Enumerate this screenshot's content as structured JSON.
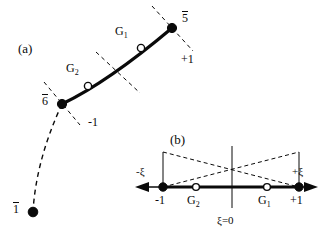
{
  "figure": {
    "type": "diagram",
    "background_color": "#ffffff",
    "line_color": "#0a0a0a"
  },
  "panel_a": {
    "tag": "(a)",
    "tag_pos": {
      "x": 18,
      "y": 42
    },
    "curve": {
      "kind": "thick-solid-arc",
      "stroke_width": 3,
      "start": {
        "x": 62,
        "y": 104
      },
      "control": {
        "x": 110,
        "y": 80
      },
      "end": {
        "x": 172,
        "y": 28
      }
    },
    "dashed_tail": {
      "kind": "thin-dashed-arc",
      "from": {
        "x": 62,
        "y": 104
      },
      "control": {
        "x": 36,
        "y": 160
      },
      "to": {
        "x": 33,
        "y": 212
      }
    },
    "nodes": [
      {
        "name": "node-6bar",
        "label": "6",
        "overbar": true,
        "fill": "filled",
        "x": 62,
        "y": 104,
        "label_pos": {
          "x": 42,
          "y": 96
        }
      },
      {
        "name": "node-G2",
        "label": "G",
        "sub": "2",
        "overbar": false,
        "fill": "open",
        "x": 88,
        "y": 86,
        "label_pos": {
          "x": 66,
          "y": 65
        }
      },
      {
        "name": "node-G1",
        "label": "G",
        "sub": "1",
        "overbar": false,
        "fill": "open",
        "x": 141,
        "y": 48,
        "label_pos": {
          "x": 115,
          "y": 28
        }
      },
      {
        "name": "node-5bar",
        "label": "5",
        "overbar": true,
        "fill": "filled",
        "x": 172,
        "y": 28,
        "label_pos": {
          "x": 182,
          "y": 13
        }
      },
      {
        "name": "node-1bar",
        "label": "1",
        "overbar": true,
        "fill": "filled",
        "x": 33,
        "y": 212,
        "label_pos": {
          "x": 13,
          "y": 203
        }
      }
    ],
    "cross_ticks": [
      {
        "name": "tick-at-node-5bar",
        "cx": 172,
        "cy": 28,
        "angle_deg": -40,
        "len": 54,
        "label": "+1",
        "label_pos": {
          "x": 180,
          "y": 56
        }
      },
      {
        "name": "tick-midpoint",
        "cx": 118,
        "cy": 73,
        "angle_deg": -42,
        "len": 58,
        "label": "",
        "label_pos": null
      },
      {
        "name": "tick-at-node-6bar",
        "cx": 62,
        "cy": 104,
        "angle_deg": -50,
        "len": 56,
        "label": "-1",
        "label_pos": {
          "x": 88,
          "y": 118
        }
      }
    ]
  },
  "panel_b": {
    "tag": "(b)",
    "tag_pos": {
      "x": 170,
      "y": 135
    },
    "axis": {
      "name": "xi-axis",
      "y": 187,
      "x_left_arrow_tip": 135,
      "x_right_arrow_tip": 318,
      "left_label": "-ξ",
      "left_label_pos": {
        "x": 136,
        "y": 168
      },
      "right_label": "+ξ",
      "right_label_pos": {
        "x": 293,
        "y": 168
      },
      "origin_label": "ξ=0",
      "origin_label_pos": {
        "x": 218,
        "y": 218
      },
      "origin_x": 232,
      "vertical_line_top": 146,
      "vertical_line_bottom": 208
    },
    "points": [
      {
        "name": "point-minus-1",
        "label": "-1",
        "fill": "filled",
        "x": 163,
        "label_pos": {
          "x": 156,
          "y": 196
        }
      },
      {
        "name": "point-G2",
        "label": "G",
        "sub": "2",
        "fill": "open",
        "x": 196,
        "label_pos": {
          "x": 188,
          "y": 196
        }
      },
      {
        "name": "point-G1",
        "label": "G",
        "sub": "1",
        "fill": "open",
        "x": 267,
        "label_pos": {
          "x": 259,
          "y": 196
        }
      },
      {
        "name": "point-plus-1",
        "label": "+1",
        "fill": "filled",
        "x": 299,
        "label_pos": {
          "x": 292,
          "y": 196
        }
      }
    ],
    "shape_functions": [
      {
        "name": "shape-fn-left",
        "from": {
          "x": 163,
          "y": 152
        },
        "to": {
          "x": 299,
          "y": 187
        }
      },
      {
        "name": "shape-fn-right",
        "from": {
          "x": 163,
          "y": 187
        },
        "to": {
          "x": 299,
          "y": 152
        }
      }
    ],
    "verticals": [
      {
        "name": "vertical-at-minus-1",
        "x": 163,
        "y_top": 152,
        "y_bottom": 187
      },
      {
        "name": "vertical-at-plus-1",
        "x": 299,
        "y_top": 152,
        "y_bottom": 187
      }
    ]
  }
}
